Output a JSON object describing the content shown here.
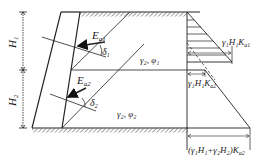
{
  "diagram": {
    "title": "",
    "labels": {
      "H1": "H",
      "H1_sub": "1",
      "H2": "H",
      "H2_sub": "2",
      "Ea1": "E",
      "Ea1_sub": "a1",
      "Ea2": "E",
      "Ea2_sub": "a2",
      "delta1": "δ",
      "delta1_sub": "1",
      "delta2": "δ",
      "delta2_sub": "2",
      "layer1_props": "γ₂, φ₁",
      "layer2_props": "γ₂, φ₂",
      "p_top_layer1": "γ₁H₁K",
      "p_top_layer1_sub": "a1",
      "p_top_layer2": "γ₁H₁K",
      "p_top_layer2_sub": "a2",
      "p_bottom": "(γ₁H₁+γ₂H₂)K",
      "p_bottom_sub": "a2"
    },
    "colors": {
      "line": "#222222",
      "background": "#ffffff"
    }
  }
}
